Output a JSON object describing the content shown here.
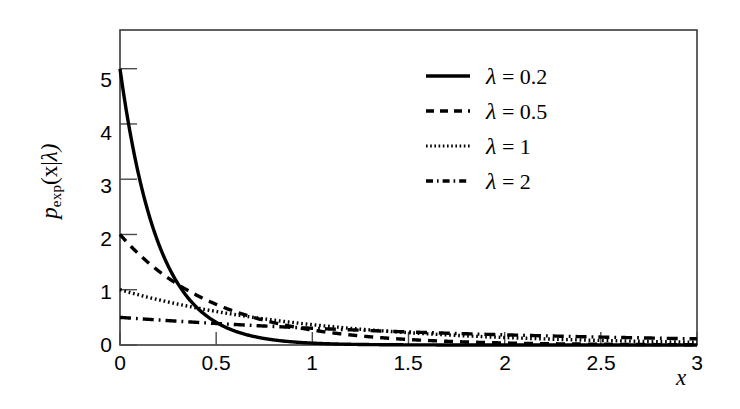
{
  "chart_data": {
    "type": "line",
    "title": "",
    "subtitle": "",
    "xlabel": "x",
    "ylabel": "p_exp(x| λ)",
    "ylabel_parts": {
      "base": "p",
      "subscript": "exp",
      "arg": "(x|",
      "cond": "λ)"
    },
    "xlim": [
      0,
      3
    ],
    "ylim": [
      0,
      5.7
    ],
    "xticks": [
      "0",
      "0.5",
      "1",
      "1.5",
      "2",
      "2.5",
      "3"
    ],
    "xtick_values": [
      0,
      0.5,
      1,
      1.5,
      2,
      2.5,
      3
    ],
    "yticks": [
      "0",
      "1",
      "2",
      "3",
      "4",
      "5"
    ],
    "ytick_values": [
      0,
      1,
      2,
      3,
      4,
      5
    ],
    "grid": false,
    "legend_position": "upper right",
    "line_color": "#000000",
    "axis_color": "#000000",
    "background": "#ffffff",
    "formula": "p_exp(x|lambda) = (1/lambda) * exp(-x/lambda)",
    "series": [
      {
        "name": "λ = 0.2",
        "lambda": 0.2,
        "peak": 5,
        "style": "solid",
        "dash": "none",
        "width": 3.4,
        "x": [
          0,
          0.1,
          0.2,
          0.3,
          0.4,
          0.5,
          0.6,
          0.7,
          0.8,
          0.9,
          1.0,
          1.25,
          1.5,
          1.75,
          2.0,
          2.5,
          3.0
        ],
        "values": [
          5.0,
          3.033,
          1.839,
          1.115,
          0.677,
          0.41,
          0.249,
          0.151,
          0.092,
          0.056,
          0.034,
          0.0096,
          0.0027,
          0.00075,
          0.00021,
          1.67e-05,
          1.3e-06
        ]
      },
      {
        "name": "λ = 0.5",
        "lambda": 0.5,
        "peak": 2,
        "style": "dashed",
        "dash": "9,7",
        "width": 3.4,
        "x": [
          0,
          0.1,
          0.2,
          0.3,
          0.4,
          0.5,
          0.6,
          0.7,
          0.8,
          0.9,
          1.0,
          1.25,
          1.5,
          1.75,
          2.0,
          2.5,
          3.0
        ],
        "values": [
          2.0,
          1.637,
          1.341,
          1.098,
          0.899,
          0.736,
          0.602,
          0.493,
          0.404,
          0.331,
          0.271,
          0.164,
          0.0996,
          0.0604,
          0.0366,
          0.0135,
          0.00496
        ]
      },
      {
        "name": "λ = 1",
        "lambda": 1,
        "peak": 1,
        "style": "dotted",
        "dash": "2,3",
        "width": 3.4,
        "x": [
          0,
          0.1,
          0.2,
          0.3,
          0.4,
          0.5,
          0.6,
          0.7,
          0.8,
          0.9,
          1.0,
          1.25,
          1.5,
          1.75,
          2.0,
          2.5,
          3.0
        ],
        "values": [
          1.0,
          0.905,
          0.819,
          0.741,
          0.67,
          0.607,
          0.549,
          0.497,
          0.449,
          0.407,
          0.368,
          0.287,
          0.223,
          0.174,
          0.135,
          0.082,
          0.0498
        ]
      },
      {
        "name": "λ = 2",
        "lambda": 2,
        "peak": 0.5,
        "style": "dashdot",
        "dash": "11,5,2,5",
        "width": 3.4,
        "x": [
          0,
          0.1,
          0.2,
          0.3,
          0.4,
          0.5,
          0.6,
          0.7,
          0.8,
          0.9,
          1.0,
          1.25,
          1.5,
          1.75,
          2.0,
          2.5,
          3.0
        ],
        "values": [
          0.5,
          0.476,
          0.452,
          0.43,
          0.409,
          0.389,
          0.37,
          0.352,
          0.335,
          0.319,
          0.303,
          0.268,
          0.236,
          0.208,
          0.184,
          0.143,
          0.112
        ]
      }
    ]
  },
  "legend": {
    "items": [
      {
        "label": "λ = 0.2",
        "lam": "λ",
        "rest": " = 0.2",
        "style": "solid"
      },
      {
        "label": "λ = 0.5",
        "lam": "λ",
        "rest": " = 0.5",
        "style": "dashed"
      },
      {
        "label": "λ = 1",
        "lam": "λ",
        "rest": " = 1",
        "style": "dotted"
      },
      {
        "label": "λ = 2",
        "lam": "λ",
        "rest": " = 2",
        "style": "dashdot"
      }
    ]
  },
  "axes": {
    "x_label": "x",
    "y_label_base": "p",
    "y_label_sub": "exp",
    "y_label_arg": "(x|",
    "y_label_cond": "λ)",
    "x_tick_labels": [
      "0",
      "0.5",
      "1",
      "1.5",
      "2",
      "2.5",
      "3"
    ],
    "y_tick_labels": [
      "5",
      "4",
      "3",
      "2",
      "1",
      "0"
    ]
  }
}
